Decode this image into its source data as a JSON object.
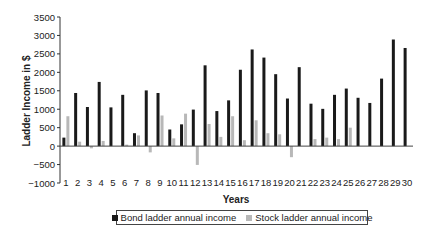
{
  "chart_data": {
    "type": "bar",
    "title": "",
    "xlabel": "Years",
    "ylabel": "Ladder Income in $",
    "ylim": [
      -1000,
      3500
    ],
    "yticks": [
      -1000,
      -500,
      0,
      500,
      1000,
      1500,
      2000,
      2500,
      3000,
      3500
    ],
    "grid": false,
    "legend_position": "bottom",
    "categories": [
      "1",
      "2",
      "3",
      "4",
      "5",
      "6",
      "7",
      "8",
      "9",
      "10",
      "11",
      "12",
      "13",
      "14",
      "15",
      "16",
      "17",
      "18",
      "19",
      "20",
      "21",
      "22",
      "23",
      "24",
      "25",
      "26",
      "27",
      "28",
      "29",
      "30"
    ],
    "series": [
      {
        "name": "Bond ladder annual income",
        "color": "#1a1a1a",
        "values": [
          230,
          1440,
          1060,
          1740,
          1050,
          1390,
          350,
          1510,
          1440,
          450,
          590,
          990,
          2190,
          950,
          1240,
          2070,
          2620,
          2400,
          1950,
          1290,
          2140,
          1150,
          1010,
          1390,
          1560,
          1310,
          1170,
          1830,
          2890,
          2660
        ]
      },
      {
        "name": "Stock ladder annual income",
        "color": "#b8b8b8",
        "values": [
          810,
          120,
          -60,
          140,
          0,
          40,
          290,
          -170,
          830,
          210,
          880,
          -510,
          600,
          250,
          810,
          160,
          700,
          350,
          320,
          -300,
          0,
          190,
          230,
          190,
          500,
          0,
          0,
          0,
          0,
          0
        ]
      }
    ]
  }
}
